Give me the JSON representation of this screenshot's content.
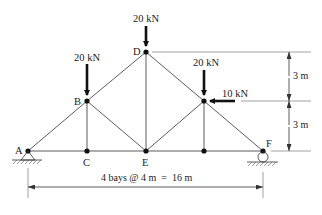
{
  "diagram": {
    "type": "truss",
    "nodes": {
      "A": {
        "label": "A"
      },
      "B": {
        "label": "B"
      },
      "C": {
        "label": "C"
      },
      "D": {
        "label": "D"
      },
      "E": {
        "label": "E"
      },
      "F": {
        "label": "F"
      }
    },
    "loads": [
      {
        "node": "D",
        "label": "20 kN",
        "direction": "down"
      },
      {
        "node": "B",
        "label": "20 kN",
        "direction": "down"
      },
      {
        "node": "upper-right",
        "label": "20 kN",
        "direction": "down"
      },
      {
        "node": "upper-right",
        "label": "10 kN",
        "direction": "left"
      }
    ],
    "supports": {
      "A": "pin",
      "F": "roller"
    },
    "dimensions": {
      "upper_height": "3 m",
      "lower_height": "3 m",
      "span": "4 bays @ 4 m  =  16 m"
    },
    "colors": {
      "members": "#4a4a4a",
      "loads": "#111111",
      "background": "#ffffff"
    }
  }
}
